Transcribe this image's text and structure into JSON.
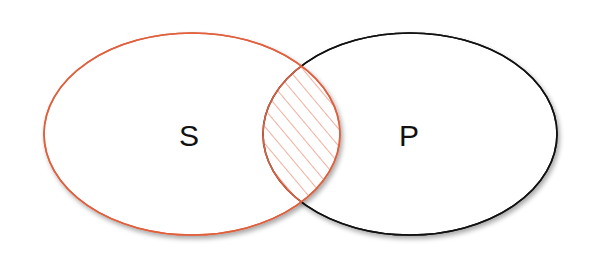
{
  "diagram": {
    "type": "venn",
    "sets": [
      {
        "id": "S",
        "label": "S",
        "stroke": "#e0603e"
      },
      {
        "id": "P",
        "label": "P",
        "stroke": "#111111"
      }
    ],
    "intersection": {
      "sets": [
        "S",
        "P"
      ],
      "shaded": true,
      "pattern": "diagonal-hatch",
      "color": "#e0603e"
    }
  }
}
